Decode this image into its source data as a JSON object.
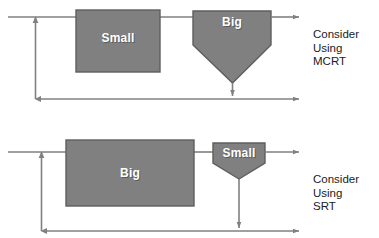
{
  "figure": {
    "colors": {
      "shape_fill": "#808080",
      "shape_stroke": "#5e5e5e",
      "line": "#808080",
      "label_text": "#ffffff",
      "caption_text": "#1b1b1b",
      "background": "#ffffff"
    }
  },
  "diagrams": [
    {
      "id": "mcrt",
      "reactor_label": "Small",
      "clarifier_label": "Big",
      "caption": {
        "line1": "Consider",
        "line2": "Using",
        "line3": "MCRT"
      }
    },
    {
      "id": "srt",
      "reactor_label": "Big",
      "clarifier_label": "Small",
      "caption": {
        "line1": "Consider",
        "line2": "Using",
        "line3": "SRT"
      }
    }
  ]
}
